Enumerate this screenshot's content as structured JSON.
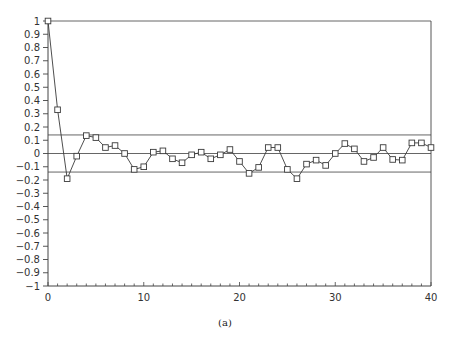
{
  "chart_data": {
    "type": "line",
    "title": "",
    "caption": "(a)",
    "xlabel": "",
    "ylabel": "",
    "xlim": [
      0,
      40
    ],
    "ylim": [
      -1,
      1
    ],
    "grid": false,
    "legend": null,
    "marker": "square",
    "x_ticks": [
      0,
      10,
      20,
      30,
      40
    ],
    "x_tick_labels": [
      "0",
      "10",
      "20",
      "30",
      "40"
    ],
    "x_minor_tick_step": 1,
    "y_ticks": [
      1,
      0.9,
      0.8,
      0.7,
      0.6,
      0.5,
      0.4,
      0.3,
      0.2,
      0.1,
      0,
      -0.1,
      -0.2,
      -0.3,
      -0.4,
      -0.5,
      -0.6,
      -0.7,
      -0.8,
      -0.9,
      -1
    ],
    "y_tick_labels": [
      "1",
      "0.9",
      "0.8",
      "0.7",
      "0.6",
      "0.5",
      "0.4",
      "0.3",
      "0.2",
      "0.1",
      "0",
      "−0.1",
      "−0.2",
      "−0.3",
      "−0.4",
      "−0.5",
      "−0.6",
      "−0.7",
      "−0.8",
      "−0.9",
      "−1"
    ],
    "reference_lines": [
      {
        "name": "top",
        "y": 1.0
      },
      {
        "name": "upper-confidence-bound",
        "y": 0.14
      },
      {
        "name": "zero",
        "y": 0.0
      },
      {
        "name": "lower-confidence-bound",
        "y": -0.14
      }
    ],
    "x": [
      0,
      1,
      2,
      3,
      4,
      5,
      6,
      7,
      8,
      9,
      10,
      11,
      12,
      13,
      14,
      15,
      16,
      17,
      18,
      19,
      20,
      21,
      22,
      23,
      24,
      25,
      26,
      27,
      28,
      29,
      30,
      31,
      32,
      33,
      34,
      35,
      36,
      37,
      38,
      39,
      40
    ],
    "series": [
      {
        "name": "autocorrelation",
        "values": [
          1.0,
          0.33,
          -0.19,
          -0.02,
          0.135,
          0.12,
          0.045,
          0.06,
          0.0,
          -0.12,
          -0.1,
          0.01,
          0.02,
          -0.04,
          -0.07,
          -0.01,
          0.01,
          -0.04,
          -0.01,
          0.03,
          -0.06,
          -0.15,
          -0.105,
          0.045,
          0.045,
          -0.12,
          -0.19,
          -0.08,
          -0.05,
          -0.09,
          0.0,
          0.075,
          0.035,
          -0.06,
          -0.03,
          0.045,
          -0.045,
          -0.05,
          0.08,
          0.08,
          0.045
        ]
      }
    ]
  },
  "colors": {
    "line": "#3a3a3a",
    "axis": "#444444",
    "reference": "#555555",
    "text": "#333333"
  }
}
